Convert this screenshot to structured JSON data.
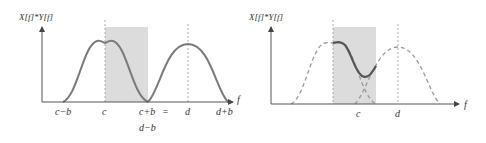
{
  "colors": {
    "curve": "#7a7a7a",
    "dashed": "#9a9a9a",
    "highlight": "#555555",
    "shade": "#d9d9d9",
    "axis": "#555555",
    "guide": "#999999"
  },
  "left_panel": {
    "y_label": "X[f]*Y[f]",
    "x_label": "f",
    "ticks": [
      {
        "key": "c_minus_b",
        "label": "c−b"
      },
      {
        "key": "c",
        "label": "c"
      },
      {
        "key": "c_plus_b",
        "label": "c+b"
      },
      {
        "key": "equals",
        "label": "="
      },
      {
        "key": "d",
        "label": "d"
      },
      {
        "key": "d_plus_b",
        "label": "d+b"
      }
    ],
    "sub_tick": "d−b"
  },
  "right_panel": {
    "y_label": "X[f]*Y[f]",
    "x_label": "f",
    "ticks": [
      {
        "key": "c",
        "label": "c"
      },
      {
        "key": "d",
        "label": "d"
      }
    ]
  }
}
